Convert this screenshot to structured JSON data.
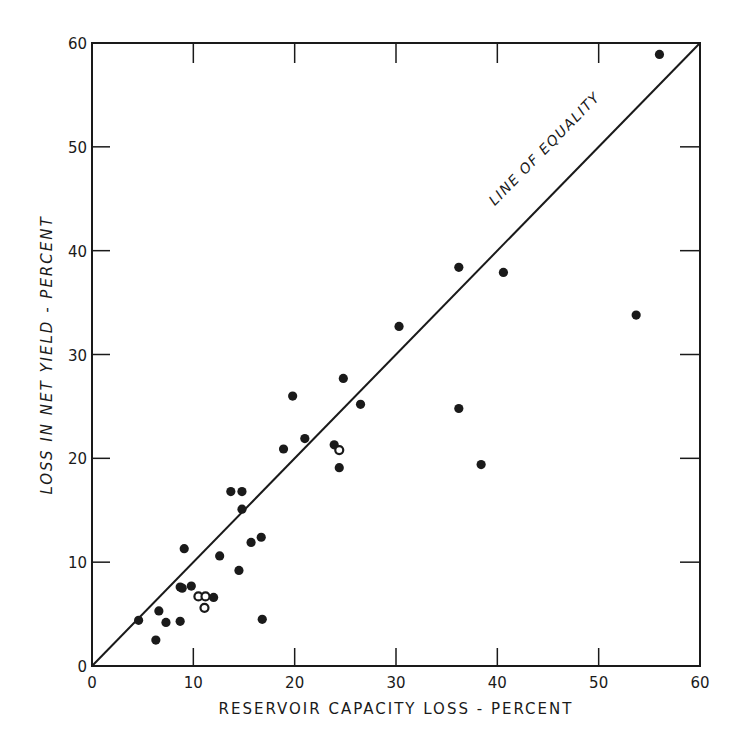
{
  "chart_data": {
    "type": "scatter",
    "title": "",
    "xlabel": "RESERVOIR CAPACITY LOSS - PERCENT",
    "ylabel": "LOSS IN NET YIELD - PERCENT",
    "xlim": [
      0,
      60
    ],
    "ylim": [
      0,
      60
    ],
    "xticks": [
      0,
      10,
      20,
      30,
      40,
      50,
      60
    ],
    "yticks": [
      0,
      10,
      20,
      30,
      40,
      50,
      60
    ],
    "xtick_labels": [
      "0",
      "10",
      "20",
      "30",
      "40",
      "50",
      "60"
    ],
    "ytick_labels": [
      "0",
      "10",
      "20",
      "30",
      "40",
      "50",
      "60"
    ],
    "grid": false,
    "legend": null,
    "reference_line": {
      "label": "LINE OF EQUALITY",
      "from": [
        0,
        0
      ],
      "to": [
        60,
        60
      ]
    },
    "annotations": [
      {
        "text": "LINE OF EQUALITY",
        "x": 45,
        "y": 50,
        "rotation": -45
      }
    ],
    "series": [
      {
        "name": "Reservoirs (solid)",
        "marker": "filled-circle",
        "points": [
          [
            4.6,
            4.4
          ],
          [
            6.3,
            2.5
          ],
          [
            6.6,
            5.3
          ],
          [
            7.3,
            4.2
          ],
          [
            8.7,
            4.3
          ],
          [
            8.7,
            7.6
          ],
          [
            8.9,
            7.5
          ],
          [
            9.1,
            11.3
          ],
          [
            9.8,
            7.7
          ],
          [
            12.0,
            6.6
          ],
          [
            12.6,
            10.6
          ],
          [
            13.7,
            16.8
          ],
          [
            14.5,
            9.2
          ],
          [
            14.8,
            16.8
          ],
          [
            14.8,
            15.1
          ],
          [
            15.7,
            11.9
          ],
          [
            16.7,
            12.4
          ],
          [
            16.8,
            4.5
          ],
          [
            18.9,
            20.9
          ],
          [
            19.8,
            26.0
          ],
          [
            21.0,
            21.9
          ],
          [
            23.9,
            21.3
          ],
          [
            24.4,
            19.1
          ],
          [
            24.8,
            27.7
          ],
          [
            26.5,
            25.2
          ],
          [
            30.3,
            32.7
          ],
          [
            36.2,
            38.4
          ],
          [
            36.2,
            24.8
          ],
          [
            38.4,
            19.4
          ],
          [
            40.6,
            37.9
          ],
          [
            53.7,
            33.8
          ],
          [
            56.0,
            58.9
          ]
        ]
      },
      {
        "name": "Reservoirs (open)",
        "marker": "open-circle",
        "points": [
          [
            10.5,
            6.7
          ],
          [
            11.2,
            6.7
          ],
          [
            11.1,
            5.6
          ],
          [
            24.4,
            20.8
          ]
        ]
      }
    ]
  },
  "colors": {
    "ink": "#1a1a1a",
    "background": "#ffffff"
  }
}
